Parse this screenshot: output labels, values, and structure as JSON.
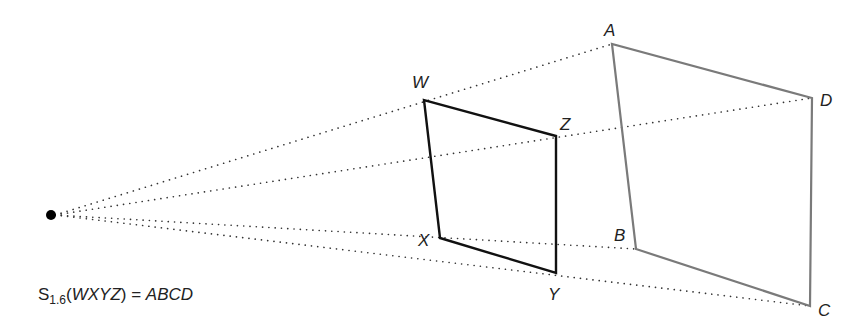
{
  "diagram": {
    "center": {
      "x": 51,
      "y": 215
    },
    "scale_factor": "1.6",
    "preimage": {
      "name": "WXYZ",
      "color": "#111111",
      "vertices": [
        {
          "label": "W",
          "x": 424,
          "y": 100,
          "lx": 412,
          "ly": 88
        },
        {
          "label": "X",
          "x": 440,
          "y": 238,
          "lx": 418,
          "ly": 246
        },
        {
          "label": "Y",
          "x": 556,
          "y": 273,
          "lx": 548,
          "ly": 300
        },
        {
          "label": "Z",
          "x": 556,
          "y": 136,
          "lx": 560,
          "ly": 130
        }
      ]
    },
    "image": {
      "name": "ABCD",
      "color": "#7a7a7a",
      "vertices": [
        {
          "label": "A",
          "x": 612,
          "y": 44,
          "lx": 604,
          "ly": 36
        },
        {
          "label": "B",
          "x": 636,
          "y": 249,
          "lx": 614,
          "ly": 241
        },
        {
          "label": "C",
          "x": 810,
          "y": 306,
          "lx": 818,
          "ly": 316
        },
        {
          "label": "D",
          "x": 812,
          "y": 98,
          "lx": 820,
          "ly": 106
        }
      ]
    },
    "rays_to": [
      "A",
      "D",
      "B",
      "C"
    ]
  },
  "caption": {
    "operator": "S",
    "subscript": "1.6",
    "open_paren": "(",
    "preimage": "WXYZ",
    "close_paren": ")",
    "equals": " = ",
    "image": "ABCD"
  }
}
